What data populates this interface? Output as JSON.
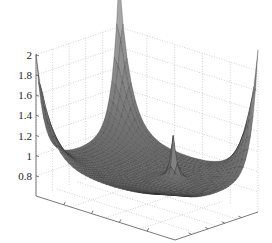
{
  "chart_data": {
    "type": "surface3d",
    "title": "",
    "xlabel": "",
    "ylabel": "",
    "zlabel": "",
    "zlim": [
      0.6,
      2.0
    ],
    "z_ticks": [
      "0.8",
      "1",
      "1.2",
      "1.4",
      "1.6",
      "1.8",
      "2"
    ],
    "z_tick_values": [
      0.8,
      1.0,
      1.2,
      1.4,
      1.6,
      1.8,
      2.0
    ],
    "x_tick_count": 4,
    "y_tick_count": 4,
    "grid": true,
    "colormap": "gray",
    "surface_description": "Bowl-shaped surface with flat central basin near z=0.9, sharp rising peaks at the four corners (~1.7 left, ~2.3 back, ~1.9 right), and a narrow spike near the center-front rising to about 1.3",
    "features": [
      {
        "name": "left-corner-peak",
        "z": 1.7
      },
      {
        "name": "back-corner-peak",
        "z": 2.3
      },
      {
        "name": "right-corner-peak",
        "z": 1.9
      },
      {
        "name": "center-spike",
        "z": 1.35
      },
      {
        "name": "basin-floor",
        "z": 0.85
      }
    ]
  }
}
